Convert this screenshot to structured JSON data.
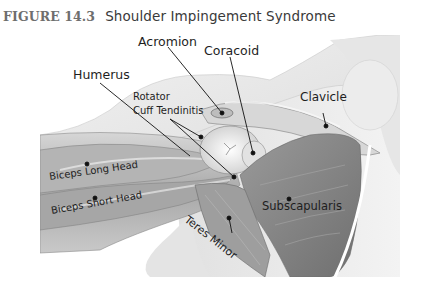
{
  "figure": {
    "number": "FIGURE 14.3",
    "title": "Shoulder Impingement Syndrome"
  },
  "colors": {
    "title_number": "#6e6e6e",
    "title_text": "#3a3a3a",
    "label_text": "#1e1e1e",
    "leader_line": "#111111"
  },
  "labels": {
    "acromion": "Acromion",
    "coracoid": "Coracoid",
    "humerus": "Humerus",
    "rotator_line1": "Rotator",
    "rotator_line2": "Cuff Tendinitis",
    "clavicle": "Clavicle",
    "biceps_long": "Biceps Long Head",
    "biceps_short": "Biceps Short Head",
    "subscapularis": "Subscapularis",
    "teres_minor": "Teres Minor"
  }
}
